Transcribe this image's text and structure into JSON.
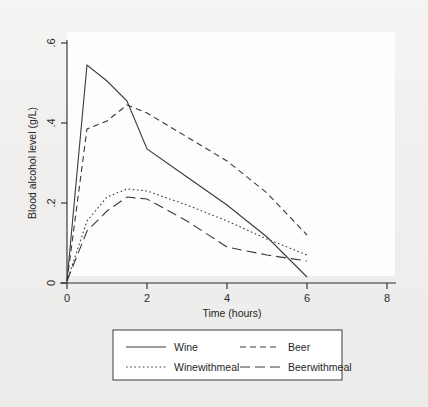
{
  "chart_data": {
    "type": "line",
    "title": "",
    "subtitle": "",
    "xlabel": "Time (hours)",
    "ylabel": "Blood alcohol level (g/L)",
    "xlim": [
      0,
      8
    ],
    "ylim": [
      0,
      0.6
    ],
    "xticks": [
      0,
      2,
      4,
      6,
      8
    ],
    "xtick_labels": [
      "0",
      "2",
      "4",
      "6",
      "8"
    ],
    "yticks": [
      0,
      0.2,
      0.4,
      0.6
    ],
    "ytick_labels": [
      "0",
      ".2",
      ".4",
      ".6"
    ],
    "grid": false,
    "legend_position": "below-outside",
    "x": [
      0,
      0.5,
      1,
      1.5,
      2,
      3,
      4,
      5,
      6
    ],
    "series": [
      {
        "name": "Wine",
        "style": "solid",
        "values": [
          0.005,
          0.545,
          0.505,
          0.455,
          0.335,
          0.265,
          0.195,
          0.115,
          0.015
        ]
      },
      {
        "name": "Beer",
        "style": "dashed",
        "values": [
          0.005,
          0.385,
          0.405,
          0.445,
          0.425,
          0.365,
          0.305,
          0.225,
          0.12
        ]
      },
      {
        "name": "Winewithmeal",
        "style": "dotted",
        "values": [
          0.005,
          0.155,
          0.215,
          0.235,
          0.23,
          0.195,
          0.155,
          0.11,
          0.07
        ]
      },
      {
        "name": "Beerwithmeal",
        "style": "longdash",
        "values": [
          0.005,
          0.13,
          0.18,
          0.215,
          0.21,
          0.155,
          0.09,
          0.07,
          0.055
        ]
      }
    ]
  },
  "legend": {
    "entries": [
      {
        "label": "Wine",
        "style": "solid"
      },
      {
        "label": "Beer",
        "style": "dashed"
      },
      {
        "label": "Winewithmeal",
        "style": "dotted"
      },
      {
        "label": "Beerwithmeal",
        "style": "longdash"
      }
    ]
  },
  "colors": {
    "line": "#3a3a3a",
    "axis": "#2b2b2b",
    "plot_background": "#fdfdfc",
    "figure_background": "#f1f1ef"
  }
}
